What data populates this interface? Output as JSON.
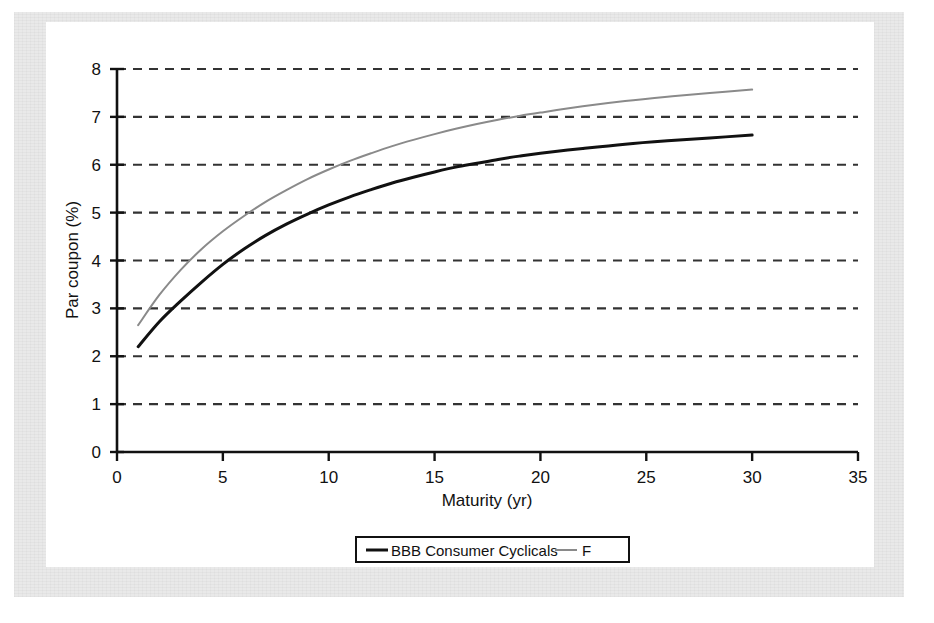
{
  "figure": {
    "background_color": "#ffffff",
    "paper_margin_color": "#e9e9e9",
    "panel_color": "#ffffff"
  },
  "chart_data": {
    "type": "line",
    "title": "",
    "subtitle": "",
    "xlabel": "Maturity (yr)",
    "ylabel": "Par coupon (%)",
    "xlim": [
      0,
      35
    ],
    "ylim": [
      0,
      8
    ],
    "xticks": [
      0,
      5,
      10,
      15,
      20,
      25,
      30,
      35
    ],
    "xticklabels": [
      "0",
      "5",
      "10",
      "15",
      "20",
      "25",
      "30",
      "35"
    ],
    "yticks": [
      0,
      1,
      2,
      3,
      4,
      5,
      6,
      7,
      8
    ],
    "yticklabels": [
      "0",
      "1",
      "2",
      "3",
      "4",
      "5",
      "6",
      "7",
      "8"
    ],
    "grid": {
      "horizontal": true,
      "vertical": false,
      "style": "dashed",
      "color": "#333333"
    },
    "legend": {
      "position": "bottom-center",
      "boxed": true,
      "entries": [
        {
          "name": "BBB Consumer Cyclicals",
          "color": "#111111",
          "linewidth": 3
        },
        {
          "name": "F",
          "color": "#8a8a8a",
          "linewidth": 2
        }
      ]
    },
    "x": [
      1,
      2,
      3,
      4,
      5,
      6,
      7,
      8,
      9,
      10,
      11,
      12,
      13,
      14,
      15,
      16,
      17,
      18,
      19,
      20,
      22,
      24,
      26,
      28,
      30
    ],
    "series": [
      {
        "name": "BBB Consumer Cyclicals",
        "color": "#111111",
        "values": [
          2.2,
          2.72,
          3.15,
          3.55,
          3.92,
          4.24,
          4.52,
          4.76,
          4.97,
          5.16,
          5.33,
          5.48,
          5.62,
          5.74,
          5.85,
          5.95,
          6.03,
          6.11,
          6.18,
          6.24,
          6.34,
          6.43,
          6.5,
          6.56,
          6.62
        ]
      },
      {
        "name": "F",
        "color": "#8a8a8a",
        "values": [
          2.65,
          3.28,
          3.8,
          4.24,
          4.61,
          4.93,
          5.22,
          5.47,
          5.7,
          5.9,
          6.08,
          6.24,
          6.39,
          6.52,
          6.64,
          6.75,
          6.85,
          6.94,
          7.02,
          7.09,
          7.22,
          7.33,
          7.42,
          7.5,
          7.57
        ]
      }
    ]
  },
  "axis_text": {
    "y_axis_label": "Par coupon (%)",
    "x_axis_label": "Maturity (yr)"
  }
}
